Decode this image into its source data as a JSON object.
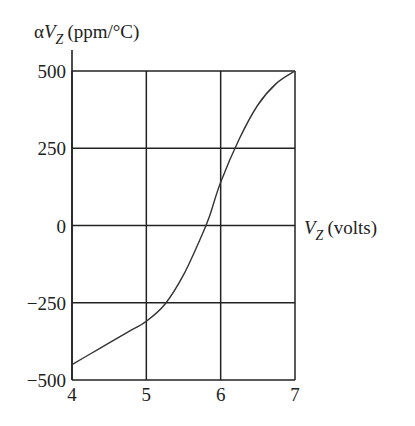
{
  "chart_data": {
    "type": "line",
    "title": "",
    "xlabel": "V_Z (volts)",
    "ylabel": "αV_Z (ppm/°C)",
    "xlabel_parts": {
      "var": "V",
      "sub": "Z",
      "unit": "(volts)"
    },
    "ylabel_parts": {
      "prefix": "α",
      "var": "V",
      "sub": "Z",
      "unit": "(ppm/°C)"
    },
    "xlim": [
      4,
      7
    ],
    "ylim": [
      -500,
      500
    ],
    "x_ticks": [
      4,
      5,
      6,
      7
    ],
    "y_ticks": [
      500,
      250,
      0,
      -250,
      -500
    ],
    "x_tick_labels": [
      "4",
      "5",
      "6",
      "7"
    ],
    "y_tick_labels": [
      "500",
      "250",
      "0",
      "−250",
      "−500"
    ],
    "grid": true,
    "legend": null,
    "series": [
      {
        "name": "Temperature coefficient of Zener voltage",
        "x": [
          4.0,
          4.25,
          4.5,
          4.75,
          5.0,
          5.25,
          5.5,
          5.75,
          5.85,
          6.0,
          6.25,
          6.5,
          6.75,
          7.0
        ],
        "y": [
          -450,
          -415,
          -380,
          -345,
          -310,
          -255,
          -160,
          -30,
          30,
          140,
          280,
          390,
          460,
          500
        ]
      }
    ],
    "color": "#333333"
  }
}
